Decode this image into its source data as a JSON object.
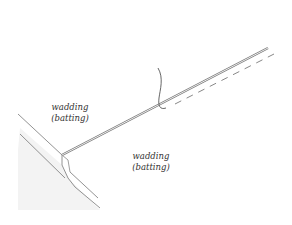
{
  "diagram": {
    "type": "illustration",
    "labels": [
      {
        "id": "left",
        "line1": "wadding",
        "line2": "(batting)"
      },
      {
        "id": "right",
        "line1": "wadding",
        "line2": "(batting)"
      }
    ],
    "elements": [
      "left-wadding-layer",
      "right-wadding-layer",
      "needle",
      "thread",
      "stitch-line-dashed"
    ],
    "colors": {
      "line": "#666666",
      "thread": "#555555",
      "shade": "#f0f0f0",
      "background": "#ffffff"
    }
  }
}
